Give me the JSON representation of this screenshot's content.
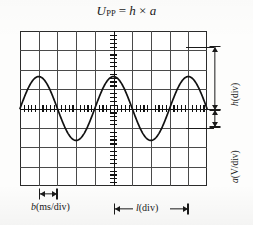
{
  "figure": {
    "title_formula": {
      "lhs_symbol": "U",
      "lhs_subscript": "PP",
      "equals": "=",
      "rhs_first": "h",
      "times": "×",
      "rhs_second": "a",
      "plain": "U_PP = h × a"
    },
    "labels": {
      "height_callout": "h(div)",
      "height_callout_symbol": "h",
      "height_callout_unit": "(div)",
      "volts_callout": "a(V/div)",
      "volts_callout_symbol": "a",
      "volts_callout_unit": "(V/div)",
      "time_per_div_callout": "b(ms/div)",
      "time_per_div_symbol": "b",
      "time_per_div_unit": "(ms/div)",
      "length_callout": "l(div)",
      "length_callout_symbol": "l",
      "length_callout_unit": "(div)"
    },
    "colors": {
      "background": "#fdfdfc",
      "screen": "#ffffff",
      "grid_line": "#4a4a4a",
      "grid_border": "#2b2b2b",
      "axis": "#111111",
      "trace": "#111111",
      "annotation": "#1a1a1a"
    }
  },
  "chart_data": {
    "type": "line",
    "xlabel": "time (divisions)",
    "ylabel": "voltage (divisions)",
    "grid": true,
    "legend": "none",
    "graticule": {
      "columns": 10,
      "rows": 8,
      "cell_px": 18.7,
      "x_center_division": 5,
      "y_center_division": 4,
      "minor_ticks_per_division": 5,
      "minor_tick_axis": "both"
    },
    "xlim": [
      -5,
      5
    ],
    "ylim": [
      -4,
      4
    ],
    "series": [
      {
        "name": "sine trace",
        "waveform": "sine",
        "amplitude_divisions": 1.65,
        "period_divisions": 4.0,
        "cycles_visible": 2.5,
        "phase": "peak at x = 0",
        "x": [
          -5.0,
          -4.5,
          -4.0,
          -3.5,
          -3.0,
          -2.5,
          -2.0,
          -1.5,
          -1.0,
          -0.5,
          0.0,
          0.5,
          1.0,
          1.5,
          2.0,
          2.5,
          3.0,
          3.5,
          4.0,
          4.5,
          5.0
        ],
        "y": [
          0.0,
          1.17,
          1.65,
          1.17,
          0.0,
          -1.17,
          -1.65,
          -1.17,
          0.0,
          1.17,
          1.65,
          1.17,
          0.0,
          -1.17,
          -1.65,
          -1.17,
          0.0,
          1.17,
          1.65,
          1.17,
          0.0
        ]
      }
    ],
    "annotations": [
      {
        "name": "h(div)",
        "kind": "vertical-dimension",
        "text": "h(div)",
        "spans_divisions": 3.3,
        "meaning": "peak-to-peak height in divisions"
      },
      {
        "name": "a(V/div)",
        "kind": "vertical-dimension",
        "text": "a(V/div)",
        "spans_divisions": 1.0,
        "meaning": "volts per division setting"
      },
      {
        "name": "b(ms/div)",
        "kind": "horizontal-dimension",
        "text": "b(ms/div)",
        "spans_divisions": 1.0,
        "meaning": "time per division setting"
      },
      {
        "name": "l(div)",
        "kind": "horizontal-dimension",
        "text": "l(div)",
        "spans_divisions": 4.0,
        "meaning": "one period length in divisions"
      }
    ]
  }
}
